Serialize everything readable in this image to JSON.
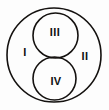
{
  "diagram": {
    "background_color": "#fdfdfd",
    "stroke_color": "#14110f",
    "label_color": "#111111",
    "canvas": {
      "width": 109,
      "height": 110
    },
    "shapes": [
      {
        "name": "outer-circle",
        "kind": "circle",
        "cx": 54,
        "cy": 55,
        "r": 47,
        "stroke_width": 1.6
      },
      {
        "name": "upper-inner-circle",
        "kind": "circle",
        "cx": 55.5,
        "cy": 35.5,
        "r": 22.5,
        "stroke_width": 1.6
      },
      {
        "name": "lower-inner-circle",
        "kind": "circle",
        "cx": 54.5,
        "cy": 78.5,
        "r": 21.5,
        "stroke_width": 1.6
      }
    ],
    "labels": [
      {
        "name": "region-label-i",
        "text": "I",
        "x": 25,
        "y": 53,
        "region": "left-lune-outside-inner-circles"
      },
      {
        "name": "region-label-ii",
        "text": "II",
        "x": 85,
        "y": 57,
        "region": "right-lune-outside-inner-circles"
      },
      {
        "name": "region-label-iii",
        "text": "III",
        "x": 55,
        "y": 33,
        "region": "upper-inner-circle-interior"
      },
      {
        "name": "region-label-iv",
        "text": "IV",
        "x": 56,
        "y": 82,
        "region": "lower-inner-circle-interior"
      }
    ]
  }
}
